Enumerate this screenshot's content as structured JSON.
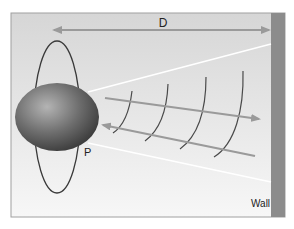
{
  "labels": {
    "distance": "D",
    "point": "P",
    "wall": "Wall"
  },
  "colors": {
    "background_light": "#f2f2f2",
    "background_dark": "#d9d9d9",
    "frame_border": "#9a9a9a",
    "wall": "#8c8c8c",
    "arrow": "#9a9a9a",
    "wavefront": "#4a4a4a",
    "orbit": "#3a3a3a",
    "sphere_highlight": "#a8a8a8",
    "sphere_shadow": "#3c3c3c",
    "cone_line": "#ffffff"
  },
  "elements": {
    "sphere": "sphere",
    "orbit_ellipse": "vertical-ellipse",
    "cone_lines": 2,
    "wavefronts": 4,
    "outgoing_arrow": "right",
    "return_arrow": "left",
    "distance_arrow": "double-headed"
  }
}
